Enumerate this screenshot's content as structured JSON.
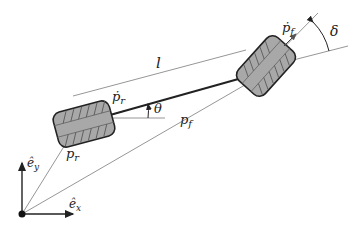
{
  "diagram": {
    "labels": {
      "wheelbase": "l",
      "rear_velocity": "ṗ",
      "rear_velocity_sub": "r",
      "front_velocity": "ṗ",
      "front_velocity_sub": "f",
      "heading_angle": "θ",
      "steering_angle": "δ",
      "rear_position": "p",
      "rear_position_sub": "r",
      "front_position": "p",
      "front_position_sub": "f",
      "axis_x": "ê",
      "axis_x_sub": "x",
      "axis_y": "ê",
      "axis_y_sub": "y"
    },
    "colors": {
      "wheel_fill": "#a8a8a8",
      "wheel_stroke": "#222222",
      "line": "#7a7a7a",
      "chassis": "#222222"
    }
  }
}
